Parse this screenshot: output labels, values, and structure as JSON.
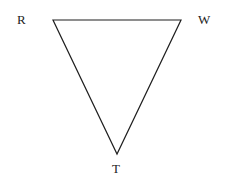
{
  "figure": {
    "type": "geometry-diagram",
    "shape": "triangle",
    "orientation": "inverted",
    "background_color": "#ffffff",
    "stroke_color": "#1f1f1f",
    "stroke_width": 1.2,
    "fill": "none",
    "canvas": {
      "width": 229,
      "height": 189
    },
    "vertices": [
      {
        "id": "R",
        "label": "R",
        "x": 53,
        "y": 20,
        "label_position": "left"
      },
      {
        "id": "W",
        "label": "W",
        "x": 181,
        "y": 20,
        "label_position": "right"
      },
      {
        "id": "T",
        "label": "T",
        "x": 117,
        "y": 154,
        "label_position": "below"
      }
    ],
    "edges": [
      {
        "id": "RW",
        "from": "R",
        "to": "W"
      },
      {
        "id": "WT",
        "from": "W",
        "to": "T"
      },
      {
        "id": "TR",
        "from": "T",
        "to": "R"
      }
    ],
    "labels": {
      "vertex_r": "R",
      "vertex_w": "W",
      "vertex_t": "T",
      "label_color": "#232323"
    }
  }
}
